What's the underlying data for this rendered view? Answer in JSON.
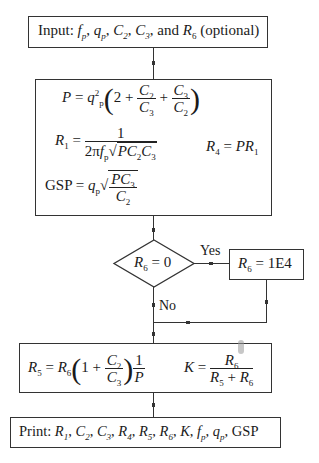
{
  "flowchart": {
    "input_box": {
      "label": "Input:",
      "vars": [
        "f",
        "p",
        "q",
        "p",
        "C",
        "2",
        "C",
        "3"
      ],
      "text_tail": "and",
      "r6": "R",
      "r6_sub": "6",
      "optional": "(optional)"
    },
    "compute_box": {
      "eq_P": {
        "lhs": "P",
        "q": "q",
        "q_sub": "p",
        "q_sup": "2",
        "two": "2",
        "plus": "+",
        "n1": "C",
        "n1s": "2",
        "d1": "C",
        "d1s": "3",
        "n2": "C",
        "n2s": "3",
        "d2": "C",
        "d2s": "2"
      },
      "eq_R1": {
        "lhs": "R",
        "lhs_sub": "1",
        "num": "1",
        "den_pre": "2π",
        "f": "f",
        "f_sub": "p",
        "root": "PC",
        "c2s": "2",
        "c3": "C",
        "c3s": "3"
      },
      "eq_R4": {
        "lhs": "R",
        "lhs_sub": "4",
        "rhs": "PR",
        "rhs_sub": "1"
      },
      "eq_GSP": {
        "lhs": "GSP",
        "q": "q",
        "q_sub": "p",
        "num": "PC",
        "num_sub": "3",
        "den": "C",
        "den_sub": "2"
      }
    },
    "decision": {
      "r": "R",
      "r_sub": "6",
      "cond": "= 0",
      "yes_label": "Yes",
      "no_label": "No"
    },
    "assign_box": {
      "r": "R",
      "r_sub": "6",
      "value": "= 1E4"
    },
    "r5_box": {
      "eq_R5": {
        "lhs": "R",
        "lhs_sub": "5",
        "r6": "R",
        "r6_sub": "6",
        "one": "1",
        "plus": "+",
        "n": "C",
        "ns": "2",
        "d": "C",
        "ds": "3",
        "fn": "1",
        "fd": "P"
      },
      "eq_K": {
        "lhs": "K",
        "num": "R",
        "num_sub": "6",
        "d1": "R",
        "d1s": "5",
        "plus": "+",
        "d2": "R",
        "d2s": "6"
      }
    },
    "print_box": {
      "label": "Print:",
      "items": [
        "R₁",
        "C₂",
        "C₃",
        "R₄",
        "R₅",
        "R₆",
        "K",
        "fₚ",
        "qₚ",
        "GSP"
      ]
    },
    "equals": "="
  }
}
